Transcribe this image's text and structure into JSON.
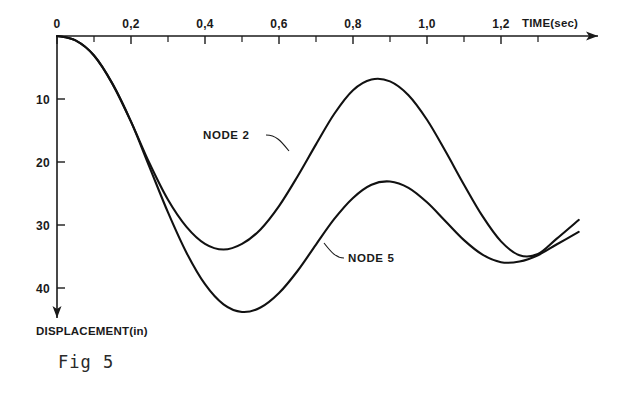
{
  "figure": {
    "caption": "Fig 5",
    "xaxis_title": "TIME(sec)",
    "yaxis_title": "DISPLACEMENT(in)"
  },
  "chart_data": {
    "type": "line",
    "title": "Fig 5",
    "xlabel": "TIME(sec)",
    "ylabel": "DISPLACEMENT(in)",
    "xlim": [
      0,
      1.45
    ],
    "ylim": [
      0,
      47
    ],
    "y_axis_direction": "downward",
    "grid": false,
    "legend": "inline-annotations",
    "x_ticks": [
      0,
      0.2,
      0.4,
      0.6,
      0.8,
      1.0,
      1.2
    ],
    "x_tick_labels": [
      "0",
      "0,2",
      "0,4",
      "0,6",
      "0,8",
      "1,0",
      "1,2"
    ],
    "x_minor_tick_step": 0.1,
    "y_ticks": [
      0,
      10,
      20,
      30,
      40
    ],
    "y_tick_labels": [
      "0",
      "10",
      "20",
      "30",
      "40"
    ],
    "series": [
      {
        "name": "NODE 2",
        "label_position": {
          "t": 0.45,
          "d": 13.5
        },
        "points": [
          {
            "t": 0.0,
            "d": 0.0
          },
          {
            "t": 0.05,
            "d": 0.7
          },
          {
            "t": 0.1,
            "d": 3.1
          },
          {
            "t": 0.15,
            "d": 7.6
          },
          {
            "t": 0.2,
            "d": 13.6
          },
          {
            "t": 0.25,
            "d": 20.2
          },
          {
            "t": 0.3,
            "d": 26.0
          },
          {
            "t": 0.35,
            "d": 30.3
          },
          {
            "t": 0.4,
            "d": 33.0
          },
          {
            "t": 0.45,
            "d": 33.9
          },
          {
            "t": 0.5,
            "d": 33.0
          },
          {
            "t": 0.55,
            "d": 30.7
          },
          {
            "t": 0.6,
            "d": 27.0
          },
          {
            "t": 0.65,
            "d": 22.3
          },
          {
            "t": 0.7,
            "d": 17.2
          },
          {
            "t": 0.75,
            "d": 12.3
          },
          {
            "t": 0.8,
            "d": 8.6
          },
          {
            "t": 0.85,
            "d": 6.9
          },
          {
            "t": 0.9,
            "d": 7.2
          },
          {
            "t": 0.95,
            "d": 9.4
          },
          {
            "t": 1.0,
            "d": 13.3
          },
          {
            "t": 1.05,
            "d": 18.3
          },
          {
            "t": 1.1,
            "d": 23.6
          },
          {
            "t": 1.15,
            "d": 28.6
          },
          {
            "t": 1.2,
            "d": 32.6
          },
          {
            "t": 1.25,
            "d": 34.8
          },
          {
            "t": 1.3,
            "d": 34.6
          },
          {
            "t": 1.35,
            "d": 32.2
          },
          {
            "t": 1.41,
            "d": 29.2
          }
        ]
      },
      {
        "name": "NODE 5",
        "label_position": {
          "t": 0.78,
          "d": 34.8
        },
        "points": [
          {
            "t": 0.0,
            "d": 0.0
          },
          {
            "t": 0.05,
            "d": 0.7
          },
          {
            "t": 0.1,
            "d": 3.1
          },
          {
            "t": 0.15,
            "d": 7.6
          },
          {
            "t": 0.2,
            "d": 13.6
          },
          {
            "t": 0.25,
            "d": 20.8
          },
          {
            "t": 0.3,
            "d": 28.0
          },
          {
            "t": 0.35,
            "d": 34.4
          },
          {
            "t": 0.4,
            "d": 39.4
          },
          {
            "t": 0.45,
            "d": 42.6
          },
          {
            "t": 0.5,
            "d": 43.8
          },
          {
            "t": 0.55,
            "d": 43.1
          },
          {
            "t": 0.6,
            "d": 40.8
          },
          {
            "t": 0.65,
            "d": 37.3
          },
          {
            "t": 0.7,
            "d": 33.1
          },
          {
            "t": 0.75,
            "d": 29.0
          },
          {
            "t": 0.8,
            "d": 25.7
          },
          {
            "t": 0.85,
            "d": 23.6
          },
          {
            "t": 0.9,
            "d": 23.1
          },
          {
            "t": 0.95,
            "d": 24.1
          },
          {
            "t": 1.0,
            "d": 26.4
          },
          {
            "t": 1.05,
            "d": 29.4
          },
          {
            "t": 1.1,
            "d": 32.4
          },
          {
            "t": 1.15,
            "d": 34.7
          },
          {
            "t": 1.2,
            "d": 35.9
          },
          {
            "t": 1.25,
            "d": 35.8
          },
          {
            "t": 1.3,
            "d": 34.8
          },
          {
            "t": 1.35,
            "d": 33.1
          },
          {
            "t": 1.41,
            "d": 31.1
          }
        ]
      }
    ]
  }
}
